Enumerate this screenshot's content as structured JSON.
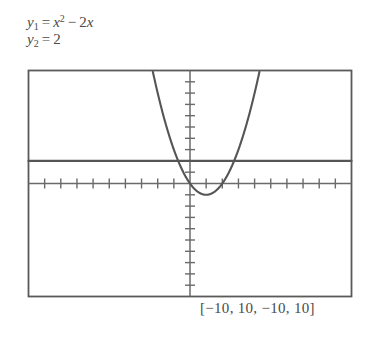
{
  "equations": {
    "y1": {
      "lhs_var": "y",
      "lhs_sub": "1",
      "equals": "=",
      "term1_var": "x",
      "term1_exp": "2",
      "operator": "−",
      "term2_coeff": "2",
      "term2_var": "x",
      "plain": "y1 = x^2 - 2x"
    },
    "y2": {
      "lhs_var": "y",
      "lhs_sub": "2",
      "equals": "=",
      "rhs": "2",
      "plain": "y2 = 2"
    }
  },
  "window_label": "[−10, 10, −10, 10]",
  "colors": {
    "ink": "#4a4a4a",
    "frame": "#5a5a5a",
    "axis": "#6a6a6a",
    "curve": "#555555",
    "background": "#ffffff"
  },
  "chart_data": {
    "type": "line",
    "title": "",
    "xlabel": "",
    "ylabel": "",
    "xlim": [
      -10,
      10
    ],
    "ylim": [
      -10,
      10
    ],
    "xtick_step": 1,
    "ytick_step": 1,
    "grid": false,
    "legend": "none",
    "window": {
      "xmin": -10,
      "xmax": 10,
      "ymin": -10,
      "ymax": 10,
      "xscl": 1,
      "yscl": 1
    },
    "annotations": [
      "y1 = x^2 - 2x",
      "y2 = 2",
      "[-10, 10, -10, 10]"
    ],
    "series": [
      {
        "name": "y1 = x^2 - 2x",
        "type": "parabola",
        "expression": "x^2 - 2x",
        "vertex": [
          1,
          -1
        ],
        "roots": [
          0,
          2
        ],
        "x": [
          -2.32,
          -2.0,
          -1.5,
          -1.0,
          -0.5,
          0.0,
          0.5,
          1.0,
          1.5,
          2.0,
          2.5,
          3.0,
          3.5,
          4.0,
          4.32
        ],
        "values": [
          10.0,
          8.0,
          5.25,
          3.0,
          1.25,
          0.0,
          -0.75,
          -1.0,
          -0.75,
          0.0,
          1.25,
          3.0,
          5.25,
          8.0,
          10.0
        ]
      },
      {
        "name": "y2 = 2",
        "type": "horizontal-line",
        "expression": "2",
        "y": 2,
        "x": [
          -10,
          10
        ],
        "values": [
          2,
          2
        ]
      }
    ],
    "intersections": [
      [
        -0.732,
        2
      ],
      [
        2.732,
        2
      ]
    ]
  }
}
